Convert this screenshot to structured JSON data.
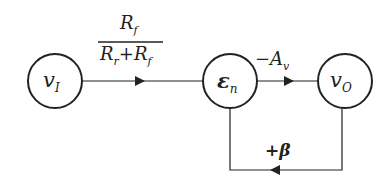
{
  "diagram": {
    "type": "signal-flow graph",
    "nodes": [
      {
        "id": "vI",
        "label": "v",
        "sub": "I"
      },
      {
        "id": "en",
        "label": "ε",
        "sub": "n"
      },
      {
        "id": "vO",
        "label": "v",
        "sub": "O"
      }
    ],
    "edges": [
      {
        "from": "vI",
        "to": "en",
        "gain_num": "R",
        "gain_num_sub": "f",
        "gain_den_a": "R",
        "gain_den_a_sub": "r",
        "gain_den_plus": "+",
        "gain_den_b": "R",
        "gain_den_b_sub": "f"
      },
      {
        "from": "en",
        "to": "vO",
        "gain": "−A",
        "gain_sub": "v"
      },
      {
        "from": "vO",
        "to": "en",
        "gain": "+β"
      }
    ]
  }
}
